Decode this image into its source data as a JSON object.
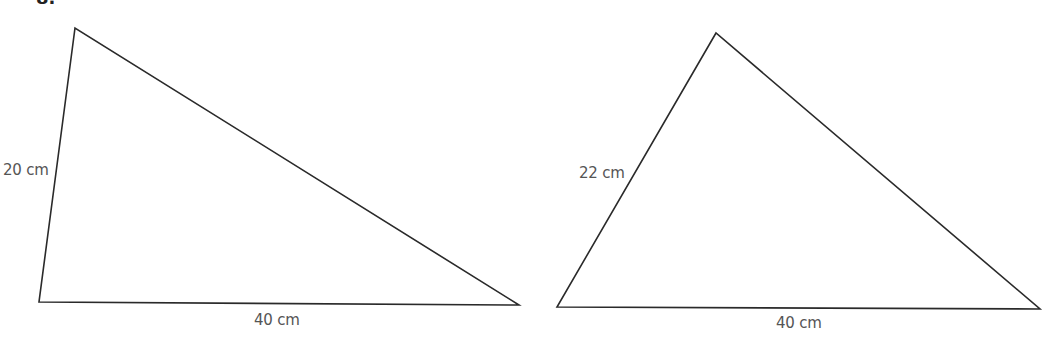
{
  "question_label_partial": "8.",
  "colors": {
    "stroke": "#2a2a2a",
    "label": "#555555",
    "background": "#ffffff"
  },
  "triangles": [
    {
      "id": "triangle-1",
      "vertices": [
        [
          75,
          28
        ],
        [
          39,
          302
        ],
        [
          519,
          305
        ]
      ],
      "labels": {
        "left_side": "20 cm",
        "base": "40 cm"
      }
    },
    {
      "id": "triangle-2",
      "vertices": [
        [
          716,
          33
        ],
        [
          557,
          307
        ],
        [
          1040,
          309
        ]
      ],
      "labels": {
        "left_side": "22 cm",
        "base": "40 cm"
      }
    }
  ]
}
